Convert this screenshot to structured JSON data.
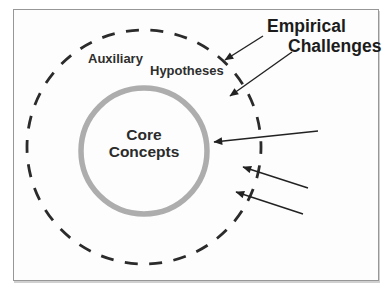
{
  "figure": {
    "labels": {
      "auxiliary": "Auxiliary",
      "hypotheses": "Hypotheses",
      "core_line1": "Core",
      "core_line2": "Concepts",
      "annotation_line1": "Empirical",
      "annotation_line2": "Challenges"
    },
    "colors": {
      "inner_ring": "#adadad",
      "dashed_circle": "#2b2b2b",
      "arrow": "#222222",
      "label_text": "#2e2e2e",
      "frame_border": "#979797",
      "background": "#fdfdfd"
    },
    "arrow_count": "5"
  }
}
